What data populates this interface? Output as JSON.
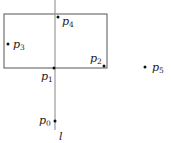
{
  "diagram": {
    "line": {
      "label": "l",
      "x": 55,
      "y1": 0,
      "y2": 130,
      "color": "#999999"
    },
    "rectangle": {
      "x": 4,
      "y": 14,
      "width": 103,
      "height": 54,
      "color": "#555555"
    },
    "points": [
      {
        "id": "p0",
        "base": "p",
        "sub": "0",
        "x": 55,
        "y": 121,
        "lx": 39,
        "ly": 124
      },
      {
        "id": "p1",
        "base": "p",
        "sub": "1",
        "x": 54,
        "y": 68,
        "lx": 41,
        "ly": 80
      },
      {
        "id": "p2",
        "base": "p",
        "sub": "2",
        "x": 104,
        "y": 66,
        "lx": 90,
        "ly": 62
      },
      {
        "id": "p3",
        "base": "p",
        "sub": "3",
        "x": 8,
        "y": 44,
        "lx": 13,
        "ly": 48
      },
      {
        "id": "p4",
        "base": "p",
        "sub": "4",
        "x": 58,
        "y": 17,
        "lx": 62,
        "ly": 25
      },
      {
        "id": "p5",
        "base": "p",
        "sub": "5",
        "x": 145,
        "y": 67,
        "lx": 152,
        "ly": 71
      }
    ]
  }
}
